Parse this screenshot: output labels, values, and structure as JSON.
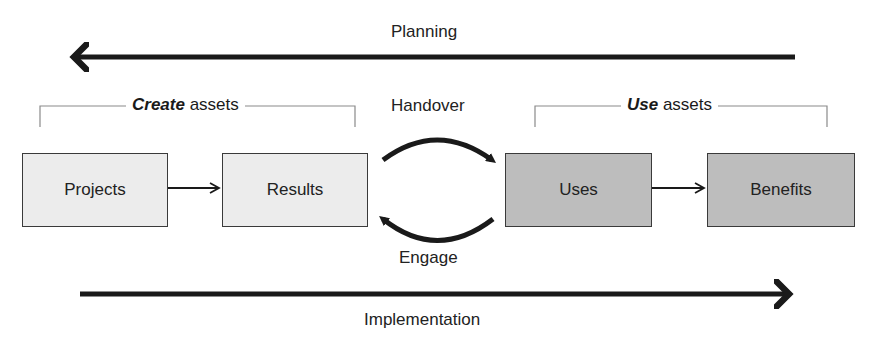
{
  "arrows": {
    "planning": {
      "label": "Planning",
      "direction": "left"
    },
    "implementation": {
      "label": "Implementation",
      "direction": "right"
    }
  },
  "groups": {
    "create": {
      "emphasis": "Create",
      "rest": " assets"
    },
    "use": {
      "emphasis": "Use",
      "rest": " assets"
    }
  },
  "boxes": [
    {
      "label": "Projects",
      "shade": "light"
    },
    {
      "label": "Results",
      "shade": "light"
    },
    {
      "label": "Uses",
      "shade": "dark"
    },
    {
      "label": "Benefits",
      "shade": "dark"
    }
  ],
  "cycle": {
    "top_label": "Handover",
    "bottom_label": "Engage"
  },
  "colors": {
    "light_box": "#ececec",
    "dark_box": "#bdbdbd",
    "stroke": "#1a1a1a"
  }
}
